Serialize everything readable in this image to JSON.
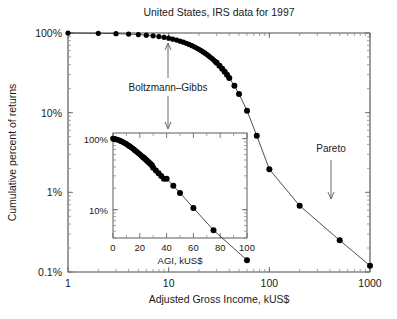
{
  "chart_data": {
    "type": "line",
    "title": "United States, IRS data for 1997",
    "xlabel": "Adjusted Gross Income, kUS$",
    "ylabel": "Cumulative percent of returns",
    "xscale": "log",
    "yscale": "log",
    "xlim": [
      1,
      1000
    ],
    "ylim": [
      0.1,
      100
    ],
    "xticks": [
      1,
      10,
      100,
      1000
    ],
    "xticklabels": [
      "1",
      "10",
      "100",
      "1000"
    ],
    "yticks": [
      100,
      10,
      1,
      0.1
    ],
    "yticklabels": [
      "100%",
      "10%",
      "1%",
      "0.1%"
    ],
    "grid": false,
    "legend": null,
    "series": [
      {
        "name": "Cumulative distribution of tax returns by AGI",
        "x": [
          1,
          2,
          3,
          4,
          5,
          6,
          7,
          8,
          9,
          10,
          11,
          12,
          13,
          14,
          15,
          16,
          17,
          18,
          19,
          20,
          21,
          22,
          23,
          24,
          25,
          26,
          27,
          28,
          29,
          30,
          32,
          34,
          36,
          38,
          40,
          45,
          50,
          60,
          75,
          100,
          200,
          500,
          1000
        ],
        "y": [
          100,
          99.2,
          98.2,
          97.0,
          95.6,
          94.0,
          92.2,
          90.3,
          88.2,
          86.0,
          83.7,
          81.4,
          79.0,
          76.6,
          74.2,
          71.8,
          69.4,
          67.0,
          64.7,
          62.4,
          60.1,
          57.9,
          55.8,
          53.7,
          51.6,
          49.6,
          47.7,
          45.8,
          44.0,
          42.2,
          38.8,
          35.6,
          32.6,
          29.9,
          27.3,
          21.7,
          17.2,
          10.6,
          5.15,
          1.95,
          0.68,
          0.25,
          0.12
        ]
      }
    ],
    "annotations": [
      {
        "text": "Boltzmann–Gibbs",
        "points_to": "low-income exponential regime"
      },
      {
        "text": "Pareto",
        "points_to": "high-income power-law tail"
      }
    ],
    "inset": {
      "type": "line",
      "xlabel": "AGI, kUS$",
      "ylabel": "",
      "xscale": "linear",
      "yscale": "log",
      "xlim": [
        0,
        100
      ],
      "ylim": [
        4,
        120
      ],
      "xticks": [
        0,
        20,
        40,
        60,
        80,
        100
      ],
      "xticklabels": [
        "0",
        "20",
        "40",
        "60",
        "80",
        "100"
      ],
      "yticks": [
        100,
        10
      ],
      "yticklabels": [
        "100%",
        "10%"
      ],
      "grid": false,
      "series": [
        {
          "name": "Exponential (Boltzmann-Gibbs) regime",
          "x": [
            0,
            1,
            2,
            3,
            4,
            5,
            6,
            7,
            8,
            9,
            10,
            11,
            12,
            13,
            14,
            15,
            16,
            17,
            18,
            19,
            20,
            21,
            22,
            23,
            24,
            25,
            26,
            27,
            28,
            29,
            30,
            32,
            34,
            36,
            38,
            40,
            45,
            50,
            60,
            75,
            100
          ],
          "y": [
            100,
            99.2,
            98.2,
            97.0,
            95.6,
            94.0,
            92.2,
            90.3,
            88.2,
            86.0,
            83.7,
            81.4,
            79.0,
            76.6,
            74.2,
            71.8,
            69.4,
            67.0,
            64.7,
            62.4,
            60.1,
            57.9,
            55.8,
            53.7,
            51.6,
            49.6,
            47.7,
            45.8,
            44.0,
            42.2,
            38.8,
            35.6,
            32.6,
            29.9,
            27.3,
            27.3,
            21.7,
            17.2,
            10.6,
            5.15,
            1.95
          ]
        }
      ]
    }
  },
  "colors": {
    "curve": "#3a3a3a",
    "point": "#000000",
    "axis": "#4a4a4a",
    "text": "#1a1a1a",
    "background": "#ffffff"
  }
}
